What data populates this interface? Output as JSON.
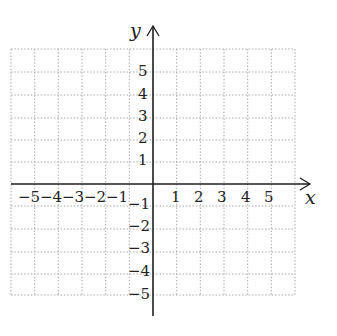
{
  "diagram": {
    "type": "coordinate-plane",
    "grid": {
      "x_min": -6,
      "x_max": 6,
      "y_min": -5,
      "y_max": 6,
      "step": 1,
      "line_style": "dotted",
      "line_color": "#aaaaaa"
    },
    "axes": {
      "color": "#222222",
      "x_label": "x",
      "y_label": "y"
    },
    "x_tick_labels": [
      "-5",
      "-4",
      "-3",
      "-2",
      "-1",
      "1",
      "2",
      "3",
      "4",
      "5"
    ],
    "y_tick_labels": [
      "5",
      "4",
      "3",
      "2",
      "1",
      "-1",
      "-2",
      "-3",
      "-4",
      "-5"
    ]
  },
  "labels": {
    "x_axis": "x",
    "y_axis": "y",
    "xt": {
      "m5": "−5",
      "m4": "−4",
      "m3": "−3",
      "m2": "−2",
      "m1": "−1",
      "p1": "1",
      "p2": "2",
      "p3": "3",
      "p4": "4",
      "p5": "5"
    },
    "yt": {
      "p5": "5",
      "p4": "4",
      "p3": "3",
      "p2": "2",
      "p1": "1",
      "m1": "−1",
      "m2": "−2",
      "m3": "−3",
      "m4": "−4",
      "m5": "−5"
    }
  }
}
